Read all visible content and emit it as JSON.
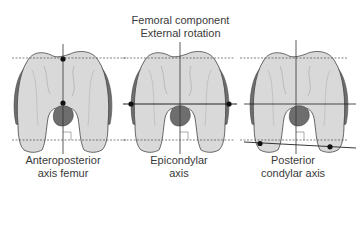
{
  "title": {
    "line1": "Femoral component",
    "line2": "External rotation"
  },
  "panels": [
    {
      "caption_line1": "Anteroposterior",
      "caption_line2": "axis femur"
    },
    {
      "caption_line1": "Epicondylar",
      "caption_line2": "axis"
    },
    {
      "caption_line1": "Posterior",
      "caption_line2": "condylar axis"
    }
  ],
  "colors": {
    "bone_fill": "#d9d9d9",
    "cartilage_dark": "#6e6e6e",
    "line": "#333333"
  }
}
